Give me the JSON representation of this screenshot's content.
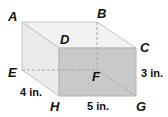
{
  "figure": {
    "type": "rectangular-prism",
    "vertices": {
      "A": {
        "label": "A",
        "x": 22,
        "y": 22
      },
      "B": {
        "label": "B",
        "x": 97,
        "y": 22
      },
      "C": {
        "label": "C",
        "x": 136,
        "y": 48
      },
      "D": {
        "label": "D",
        "x": 59,
        "y": 48
      },
      "E": {
        "label": "E",
        "x": 22,
        "y": 70
      },
      "F": {
        "label": "F",
        "x": 97,
        "y": 70
      },
      "G": {
        "label": "G",
        "x": 136,
        "y": 96
      },
      "H": {
        "label": "H",
        "x": 59,
        "y": 96
      }
    },
    "dimensions": {
      "depth": "4 in.",
      "length": "5 in.",
      "height": "3 in."
    },
    "colors": {
      "top_face": "#f2f2f2",
      "left_face": "#e9e9e9",
      "front_face": "#c8c8c8",
      "edge": "#bdbdbd",
      "hidden_edge": "#a8a8a8"
    }
  }
}
